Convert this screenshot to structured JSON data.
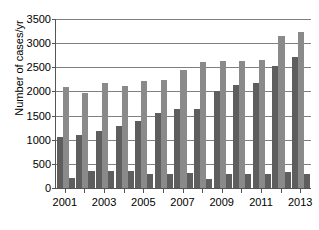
{
  "chart_data": {
    "type": "bar",
    "title": "",
    "xlabel": "",
    "ylabel": "Number of cases/yr",
    "ylim": [
      0,
      3500
    ],
    "yticks": [
      0,
      500,
      1000,
      1500,
      2000,
      2500,
      3000,
      3500
    ],
    "ytick_labels": [
      "0",
      "500",
      "1000",
      "1500",
      "2000",
      "2500",
      "3000",
      "3500"
    ],
    "grid": true,
    "legend": "none",
    "categories": [
      "2001",
      "2002",
      "2003",
      "2004",
      "2005",
      "2006",
      "2007",
      "2008",
      "2009",
      "2010",
      "2011",
      "2012",
      "2013"
    ],
    "xtick_labels": [
      "2001",
      "",
      "2003",
      "",
      "2005",
      "",
      "2007",
      "",
      "2009",
      "",
      "2011",
      "",
      "2013"
    ],
    "visible_xtick_labels": [
      "2001",
      "2003",
      "2005",
      "2007",
      "2009",
      "2011",
      "2013"
    ],
    "series": [
      {
        "name": "series-1",
        "color": "#5e5e5e",
        "values": [
          1060,
          1100,
          1190,
          1290,
          1390,
          1550,
          1640,
          1640,
          2000,
          2140,
          2180,
          2520,
          2720
        ]
      },
      {
        "name": "series-2",
        "color": "#8a8a8a",
        "values": [
          2090,
          1970,
          2170,
          2110,
          2210,
          2240,
          2440,
          2610,
          2640,
          2630,
          2650,
          3140,
          3230
        ]
      },
      {
        "name": "series-3",
        "color": "#5e5e5e",
        "values": [
          210,
          360,
          360,
          360,
          280,
          290,
          310,
          190,
          300,
          300,
          300,
          330,
          300
        ]
      }
    ]
  }
}
